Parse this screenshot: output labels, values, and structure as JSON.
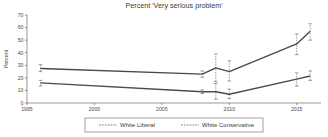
{
  "chart_data": {
    "type": "line",
    "title": "Percent 'Very serious problem'",
    "xlabel": "",
    "ylabel": "Percent",
    "xlim": [
      1995,
      2016.8
    ],
    "ylim": [
      0,
      70
    ],
    "xticks": [
      1995,
      2000,
      2005,
      2010,
      2015
    ],
    "xticklabels": [
      "1995",
      "2000",
      "2005",
      "2010",
      "2015"
    ],
    "yticks": [
      0,
      10,
      20,
      30,
      40,
      50,
      60,
      70
    ],
    "yticklabels": [
      "0",
      "10",
      "20",
      "30",
      "40",
      "50",
      "60",
      "70"
    ],
    "grid": false,
    "legend_position": "bottom-center",
    "error_bars": true,
    "x": [
      1996,
      2008,
      2009,
      2010,
      2015,
      2016
    ],
    "series": [
      {
        "name": "White Liberal",
        "values": [
          16,
          9,
          9,
          7,
          19,
          21.5
        ],
        "err_low": [
          13.5,
          7.5,
          3,
          3.5,
          13.5,
          18
        ],
        "err_high": [
          18,
          10.5,
          15.5,
          11,
          24,
          25.5
        ]
      },
      {
        "name": "White Conservative",
        "values": [
          27.5,
          23,
          28,
          25,
          47,
          57
        ],
        "err_low": [
          25,
          20.5,
          17,
          17.5,
          38.5,
          50
        ],
        "err_high": [
          30.5,
          25.5,
          39,
          33.5,
          55,
          63
        ]
      }
    ]
  },
  "legend": {
    "entries": [
      {
        "label": "White Liberal"
      },
      {
        "label": "White Conservative"
      }
    ]
  }
}
